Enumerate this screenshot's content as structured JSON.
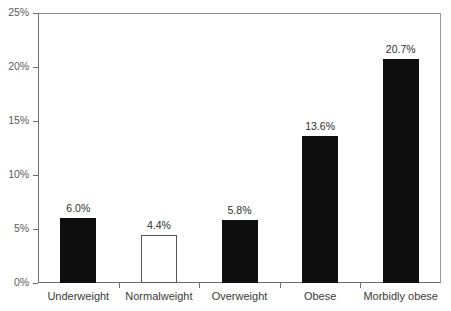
{
  "chart_data": {
    "type": "bar",
    "title": "",
    "subtitle": "",
    "xlabel": "",
    "ylabel": "",
    "categories": [
      "Underweight",
      "Normalweight",
      "Overweight",
      "Obese",
      "Morbidly obese"
    ],
    "values": [
      6.0,
      4.4,
      5.8,
      13.6,
      20.7
    ],
    "value_labels": [
      "6.0%",
      "4.4%",
      "5.8%",
      "13.6%",
      "20.7%"
    ],
    "bar_styles": [
      "filled",
      "hollow",
      "filled",
      "filled",
      "filled"
    ],
    "ylim": [
      0,
      25
    ],
    "ytick_values": [
      0,
      5,
      10,
      15,
      20,
      25
    ],
    "ytick_labels": [
      "0%",
      "5%",
      "10%",
      "15%",
      "20%",
      "25%"
    ],
    "grid": false,
    "legend": null,
    "colors": {
      "bar_fill": "#0f0f0f",
      "bar_outline": "#555555",
      "axis": "#6e6e6e",
      "tick_text": "#5b5b5b",
      "category_text": "#3a3a3a",
      "value_text": "#2e2e2e",
      "background": "#ffffff"
    }
  }
}
